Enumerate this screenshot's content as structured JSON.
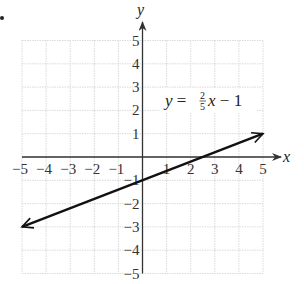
{
  "chart_data": {
    "type": "line",
    "title": "",
    "xlabel": "x",
    "ylabel": "y",
    "xlim": [
      -5,
      5
    ],
    "ylim": [
      -5,
      5
    ],
    "grid": true,
    "x_ticks": [
      "-5",
      "-4",
      "-3",
      "-2",
      "-1",
      "1",
      "2",
      "3",
      "4",
      "5"
    ],
    "y_ticks": [
      "5",
      "4",
      "3",
      "2",
      "1",
      "-1",
      "-2",
      "-3",
      "-4",
      "-5"
    ],
    "series": [
      {
        "name": "y = 2/5 x - 1",
        "x": [
          -5,
          5
        ],
        "y": [
          -3,
          1
        ],
        "arrows": "both"
      }
    ],
    "annotations": [
      {
        "text": "y = 2/5 x − 1",
        "x": 2.9,
        "y": 2.3
      }
    ]
  },
  "labels": {
    "x_axis": "x",
    "y_axis": "y",
    "equation_lhs": "y",
    "equation_eq": " = ",
    "equation_num": "2",
    "equation_den": "5",
    "equation_var": "x",
    "equation_rhs": " − 1"
  },
  "colors": {
    "grid": "#d0d0d0",
    "axis": "#333333",
    "line": "#111111"
  }
}
